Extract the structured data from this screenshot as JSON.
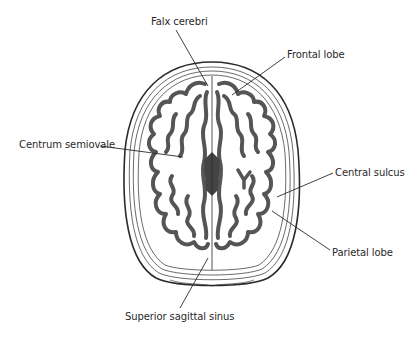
{
  "diagram": {
    "colors": {
      "background": "#ffffff",
      "outline": "#2a2a2a",
      "gray_matter": "#555555",
      "white_matter": "#ffffff"
    },
    "labels": [
      {
        "id": "falx-cerebri",
        "text": "Falx cerebri"
      },
      {
        "id": "frontal-lobe",
        "text": "Frontal lobe"
      },
      {
        "id": "centrum-semiovale",
        "text": "Centrum semiovale"
      },
      {
        "id": "central-sulcus",
        "text": "Central sulcus"
      },
      {
        "id": "parietal-lobe",
        "text": "Parietal lobe"
      },
      {
        "id": "superior-sagittal-sinus",
        "text": "Superior sagittal sinus"
      }
    ]
  }
}
